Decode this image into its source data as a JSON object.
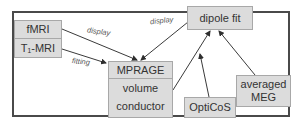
{
  "diagram": {
    "nodes": {
      "fmri": "fMRI",
      "t1mri": "T₁-MRI",
      "dipole_fit": "dipole fit",
      "mprage_title": "MPRAGE",
      "mprage_line2": "volume",
      "mprage_line3": "conductor",
      "opticos": "OptiCoS",
      "averaged_meg_line1": "averaged",
      "averaged_meg_line2": "MEG"
    },
    "edge_labels": {
      "fmri_to_mprage": "display",
      "mprage_to_dipole": "display",
      "t1_to_mprage": "fitting"
    },
    "edges": [
      {
        "from": "fMRI",
        "to": "MPRAGE",
        "label": "display"
      },
      {
        "from": "T1-MRI",
        "to": "MPRAGE",
        "label": "fitting"
      },
      {
        "from": "dipole fit",
        "to": "MPRAGE",
        "label": "display"
      },
      {
        "from": "volume conductor",
        "to": "dipole fit",
        "label": ""
      },
      {
        "from": "OptiCoS",
        "to": "dipole fit",
        "label": ""
      },
      {
        "from": "averaged MEG",
        "to": "dipole fit",
        "label": ""
      }
    ],
    "colors": {
      "node_fill": "#dcdcdc",
      "node_border": "#a8a8a8",
      "frame": "#4a4a4a",
      "arrow": "#3a3a3a"
    }
  }
}
